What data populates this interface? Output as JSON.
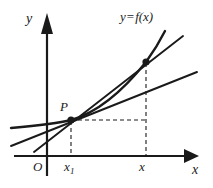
{
  "figure": {
    "kind": "calculus-tangent-secant-diagram",
    "background_color": "#ffffff",
    "stroke_color": "#1a1a1a",
    "width": 213,
    "height": 188,
    "axes": {
      "y_axis_label": "y",
      "x_axis_label": "x",
      "origin_label": "O",
      "origin_px": {
        "x": 47,
        "y": 156
      },
      "x_axis": {
        "x1": 14,
        "y1": 156,
        "x2": 196,
        "y2": 156
      },
      "y_axis": {
        "x1": 47,
        "y1": 174,
        "x2": 47,
        "y2": 20
      },
      "arrowheads": [
        "x-axis-right",
        "y-axis-top"
      ]
    },
    "curve": {
      "label": "y = f(x)",
      "label_lhs": "y",
      "label_eq": "=",
      "label_rhs": "f(x)",
      "description": "increasing convex curve through P and Q"
    },
    "points": [
      {
        "name": "P",
        "label": "P",
        "px": {
          "x": 71,
          "y": 120
        },
        "tick_label": "x",
        "tick_sub": "1"
      },
      {
        "name": "Q",
        "label": "",
        "px": {
          "x": 146,
          "y": 62
        },
        "tick_label": "x",
        "tick_sub": ""
      }
    ],
    "ticks": [
      {
        "label": "x",
        "sub": "1",
        "px_x": 71
      },
      {
        "label": "x",
        "sub": "",
        "px_x": 146
      }
    ],
    "lines": [
      {
        "name": "secant-line-PQ",
        "style": "solid",
        "through": [
          "P",
          "Q"
        ]
      },
      {
        "name": "tangent-line-at-P",
        "style": "solid",
        "through": [
          "P"
        ]
      },
      {
        "name": "curve-y-equals-fx",
        "style": "solid-curve",
        "through": [
          "P",
          "Q"
        ]
      }
    ],
    "dashed": [
      {
        "name": "horizontal-from-P-to-Q-vertical",
        "from": {
          "x": 71,
          "y": 120
        },
        "to": {
          "x": 146,
          "y": 120
        }
      },
      {
        "name": "vertical-drop-at-x1",
        "from": {
          "x": 71,
          "y": 120
        },
        "to": {
          "x": 71,
          "y": 156
        }
      },
      {
        "name": "vertical-drop-at-x",
        "from": {
          "x": 146,
          "y": 62
        },
        "to": {
          "x": 146,
          "y": 156
        }
      }
    ]
  }
}
